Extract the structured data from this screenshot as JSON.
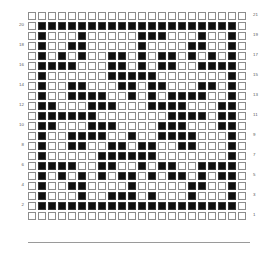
{
  "chart_data": {
    "type": "heatmap",
    "title": "",
    "subtitle": "",
    "xlabel": "",
    "ylabel": "",
    "grid": true,
    "legend": "none",
    "columns": 22,
    "rows": 21,
    "cell_states": [
      "empty",
      "filled"
    ],
    "row_numbering": {
      "direction": "bottom-to-top",
      "left_axis_ticks": [
        20,
        18,
        16,
        14,
        12,
        10,
        8,
        6,
        4,
        2
      ],
      "right_axis_ticks": [
        21,
        19,
        17,
        15,
        13,
        11,
        9,
        7,
        5,
        3,
        1
      ],
      "left_axis_parity": "even",
      "right_axis_parity": "odd"
    },
    "colors": {
      "background": "#ffffff",
      "cell_outline": "#8c8c8c",
      "cell_fill": "#111111",
      "axis_label": "#575757"
    },
    "matrix_description": "22-column by 21-row binary pattern chart; 1 = filled square, 0 = empty square. Row index 0 is the topmost drawn row (chart row 21).",
    "matrix": [
      [
        0,
        0,
        0,
        0,
        0,
        0,
        0,
        0,
        0,
        0,
        0,
        0,
        0,
        0,
        0,
        0,
        0,
        0,
        0,
        0,
        0,
        0
      ],
      [
        0,
        1,
        1,
        1,
        1,
        1,
        1,
        1,
        1,
        1,
        1,
        1,
        1,
        1,
        1,
        1,
        1,
        1,
        1,
        1,
        1,
        0
      ],
      [
        0,
        1,
        0,
        0,
        0,
        1,
        0,
        0,
        0,
        0,
        0,
        1,
        1,
        1,
        0,
        0,
        0,
        1,
        0,
        0,
        1,
        0
      ],
      [
        0,
        1,
        0,
        0,
        1,
        1,
        0,
        0,
        0,
        0,
        0,
        1,
        0,
        0,
        0,
        0,
        1,
        1,
        0,
        0,
        1,
        0
      ],
      [
        0,
        1,
        0,
        1,
        0,
        1,
        0,
        0,
        1,
        1,
        0,
        1,
        0,
        1,
        1,
        0,
        1,
        0,
        1,
        0,
        1,
        0
      ],
      [
        0,
        1,
        1,
        1,
        1,
        0,
        0,
        0,
        1,
        1,
        0,
        1,
        0,
        1,
        1,
        0,
        0,
        1,
        1,
        1,
        1,
        0
      ],
      [
        0,
        1,
        0,
        0,
        0,
        0,
        0,
        0,
        1,
        1,
        1,
        1,
        1,
        0,
        0,
        0,
        0,
        0,
        0,
        0,
        1,
        0
      ],
      [
        0,
        1,
        0,
        0,
        1,
        1,
        0,
        0,
        0,
        1,
        1,
        0,
        1,
        1,
        0,
        0,
        0,
        1,
        1,
        0,
        1,
        0
      ],
      [
        0,
        1,
        0,
        0,
        1,
        1,
        1,
        1,
        0,
        0,
        1,
        0,
        1,
        0,
        1,
        1,
        1,
        1,
        0,
        0,
        1,
        0
      ],
      [
        0,
        1,
        1,
        0,
        0,
        0,
        1,
        1,
        1,
        0,
        0,
        0,
        1,
        1,
        1,
        1,
        0,
        0,
        0,
        1,
        1,
        0
      ],
      [
        0,
        1,
        1,
        1,
        1,
        1,
        1,
        0,
        0,
        0,
        0,
        0,
        0,
        0,
        1,
        1,
        1,
        1,
        0,
        1,
        1,
        0
      ],
      [
        0,
        1,
        1,
        0,
        0,
        0,
        1,
        1,
        1,
        0,
        0,
        0,
        0,
        1,
        1,
        1,
        0,
        0,
        0,
        1,
        1,
        0
      ],
      [
        0,
        1,
        0,
        0,
        1,
        1,
        1,
        1,
        0,
        0,
        1,
        0,
        0,
        1,
        1,
        1,
        1,
        0,
        0,
        0,
        1,
        0
      ],
      [
        0,
        1,
        0,
        0,
        1,
        1,
        0,
        0,
        1,
        1,
        0,
        1,
        1,
        0,
        0,
        1,
        1,
        0,
        0,
        0,
        1,
        0
      ],
      [
        0,
        1,
        0,
        0,
        0,
        0,
        0,
        1,
        1,
        1,
        1,
        1,
        1,
        0,
        0,
        0,
        0,
        0,
        0,
        0,
        1,
        0
      ],
      [
        0,
        1,
        1,
        1,
        1,
        0,
        0,
        1,
        1,
        0,
        0,
        1,
        0,
        1,
        1,
        0,
        0,
        1,
        1,
        1,
        1,
        0
      ],
      [
        0,
        1,
        0,
        1,
        0,
        1,
        0,
        1,
        0,
        1,
        1,
        0,
        1,
        0,
        1,
        1,
        0,
        1,
        0,
        1,
        1,
        0
      ],
      [
        0,
        1,
        0,
        0,
        1,
        1,
        0,
        0,
        0,
        0,
        1,
        0,
        0,
        0,
        0,
        0,
        1,
        1,
        0,
        0,
        1,
        0
      ],
      [
        0,
        1,
        0,
        0,
        0,
        1,
        0,
        0,
        1,
        1,
        1,
        0,
        1,
        0,
        0,
        0,
        1,
        0,
        0,
        0,
        1,
        0
      ],
      [
        0,
        1,
        1,
        1,
        1,
        1,
        1,
        1,
        1,
        1,
        1,
        1,
        1,
        1,
        1,
        1,
        1,
        1,
        1,
        1,
        1,
        0
      ],
      [
        0,
        0,
        0,
        0,
        0,
        0,
        0,
        0,
        0,
        0,
        0,
        0,
        0,
        0,
        0,
        0,
        0,
        0,
        0,
        0,
        0,
        0
      ]
    ]
  },
  "axes": {
    "left": {
      "name": "left-row-numbers",
      "ticks": [
        "20",
        "18",
        "16",
        "14",
        "12",
        "10",
        "8",
        "6",
        "4",
        "2"
      ]
    },
    "right": {
      "name": "right-row-numbers",
      "ticks": [
        "21",
        "19",
        "17",
        "15",
        "13",
        "11",
        "9",
        "7",
        "5",
        "3",
        "1"
      ]
    }
  }
}
